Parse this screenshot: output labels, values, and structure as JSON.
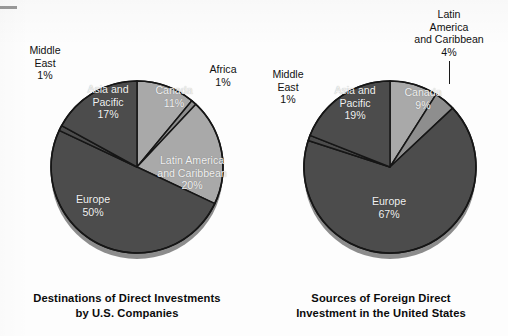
{
  "figure": {
    "background": "#fdfdfd",
    "dark_slice_color": "#4c4c4c",
    "light_slice_color": "#a9a9a9",
    "mid_slice_color": "#8e8e8e",
    "outline_color": "#161616",
    "label_text_color": "#111111",
    "inner_text_color": "#f2f2f2"
  },
  "charts": [
    {
      "id": "destinations",
      "caption_line1": "Destinations of Direct Investments",
      "caption_line2": "by U.S. Companies",
      "center": {
        "x": 137,
        "y": 167
      },
      "radius": 86,
      "labels": {
        "middle_east": {
          "name": "Middle",
          "name2": "East",
          "value": "1%"
        },
        "asia_pacific": {
          "name": "Asia and",
          "name2": "Pacific",
          "value": "17%"
        },
        "canada": {
          "name": "Canada",
          "value": "11%"
        },
        "africa": {
          "name": "Africa",
          "value": "1%"
        },
        "latin_america": {
          "name": "Latin America",
          "name2": "and Caribbean",
          "value": "20%"
        },
        "europe": {
          "name": "Europe",
          "value": "50%"
        }
      }
    },
    {
      "id": "sources",
      "caption_line1": "Sources of Foreign Direct",
      "caption_line2": "Investment in the United States",
      "center": {
        "x": 136,
        "y": 167
      },
      "radius": 86,
      "labels": {
        "middle_east": {
          "name": "Middle",
          "name2": "East",
          "value": "1%"
        },
        "asia_pacific": {
          "name": "Asia and",
          "name2": "Pacific",
          "value": "19%"
        },
        "canada": {
          "name": "Canada",
          "value": "9%"
        },
        "latin_america": {
          "name": "Latin",
          "name2": "America",
          "name3": "and Caribbean",
          "value": "4%"
        },
        "europe": {
          "name": "Europe",
          "value": "67%"
        }
      }
    }
  ],
  "chart_data": [
    {
      "type": "pie",
      "title": "Destinations of Direct Investments by U.S. Companies",
      "categories": [
        "Canada",
        "Africa",
        "Latin America and Caribbean",
        "Europe",
        "Middle East",
        "Asia and Pacific"
      ],
      "values": [
        11,
        1,
        20,
        50,
        1,
        17
      ],
      "labels": [
        "Canada 11%",
        "Africa 1%",
        "Latin America and Caribbean 20%",
        "Europe 50%",
        "Middle East 1%",
        "Asia and Pacific 17%"
      ],
      "unit": "percent",
      "start_angle_deg": 0,
      "direction": "clockwise",
      "colors": [
        "#a9a9a9",
        "#8e8e8e",
        "#a9a9a9",
        "#4c4c4c",
        "#4c4c4c",
        "#4c4c4c"
      ],
      "legend": "none",
      "grid": false
    },
    {
      "type": "pie",
      "title": "Sources of Foreign Direct Investment in the United States",
      "categories": [
        "Canada",
        "Latin America and Caribbean",
        "Europe",
        "Middle East",
        "Asia and Pacific"
      ],
      "values": [
        9,
        4,
        67,
        1,
        19
      ],
      "labels": [
        "Canada 9%",
        "Latin America and Caribbean 4%",
        "Europe 67%",
        "Middle East 1%",
        "Asia and Pacific 19%"
      ],
      "unit": "percent",
      "start_angle_deg": 0,
      "direction": "clockwise",
      "colors": [
        "#a9a9a9",
        "#8e8e8e",
        "#4c4c4c",
        "#4c4c4c",
        "#4c4c4c"
      ],
      "legend": "none",
      "grid": false
    }
  ]
}
